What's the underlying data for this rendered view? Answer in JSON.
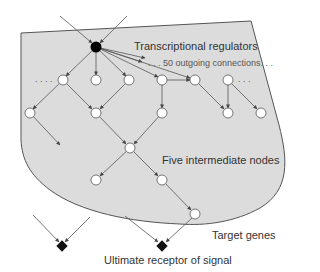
{
  "diagram": {
    "labels": {
      "transcriptional_regulators": "Transcriptional regulators",
      "outgoing_connections": ". . . 50 outgoing connections. . .",
      "intermediate_nodes": "Five intermediate nodes",
      "target_genes": "Target genes",
      "ultimate_receptor": "Ultimate receptor of signal",
      "ellipsis_left": ". . . .",
      "ellipsis_right": ". . ."
    },
    "colors": {
      "region_fill": "#dcdcdc",
      "region_stroke": "#555555",
      "edge": "#555555",
      "hub_node": "#000000",
      "node_fill": "#ffffff",
      "receptor": "#111111"
    },
    "nodes": [
      {
        "id": "hub",
        "type": "regulator",
        "x": 96,
        "y": 47
      },
      {
        "id": "r1a",
        "x": 63,
        "y": 80
      },
      {
        "id": "r1b",
        "x": 96,
        "y": 80
      },
      {
        "id": "r1c",
        "x": 129,
        "y": 80
      },
      {
        "id": "r1d",
        "x": 162,
        "y": 80
      },
      {
        "id": "r1e",
        "x": 195,
        "y": 80
      },
      {
        "id": "r1f",
        "x": 228,
        "y": 80
      },
      {
        "id": "r2a",
        "x": 30,
        "y": 113
      },
      {
        "id": "r2b",
        "x": 96,
        "y": 113
      },
      {
        "id": "r2c",
        "x": 162,
        "y": 113
      },
      {
        "id": "r2d",
        "x": 228,
        "y": 113
      },
      {
        "id": "r2e",
        "x": 261,
        "y": 113
      },
      {
        "id": "mid",
        "x": 130,
        "y": 148
      },
      {
        "id": "r4a",
        "x": 96,
        "y": 180
      },
      {
        "id": "r4b",
        "x": 162,
        "y": 180
      },
      {
        "id": "r5",
        "x": 195,
        "y": 214
      }
    ],
    "receptors": [
      {
        "id": "rec1",
        "x": 62,
        "y": 246
      },
      {
        "id": "rec2",
        "x": 162,
        "y": 246
      }
    ]
  }
}
